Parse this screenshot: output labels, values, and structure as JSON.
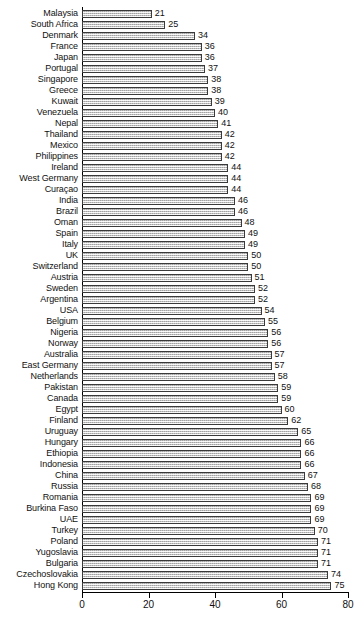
{
  "chart_data": {
    "type": "bar",
    "orientation": "horizontal",
    "title": "",
    "subtitle": "",
    "xlabel": "",
    "ylabel": "",
    "xlim": [
      0,
      80
    ],
    "xticks": [
      0,
      20,
      40,
      60,
      80
    ],
    "grid": false,
    "legend": null,
    "bar_value_labels": true,
    "categories": [
      "Malaysia",
      "South Africa",
      "Denmark",
      "France",
      "Japan",
      "Portugal",
      "Singapore",
      "Greece",
      "Kuwait",
      "Venezuela",
      "Nepal",
      "Thailand",
      "Mexico",
      "Philippines",
      "Ireland",
      "West Germany",
      "Curaçao",
      "India",
      "Brazil",
      "Oman",
      "Spain",
      "Italy",
      "UK",
      "Switzerland",
      "Austria",
      "Sweden",
      "Argentina",
      "USA",
      "Belgium",
      "Nigeria",
      "Norway",
      "Australia",
      "East Germany",
      "Netherlands",
      "Pakistan",
      "Canada",
      "Egypt",
      "Finland",
      "Uruguay",
      "Hungary",
      "Ethiopia",
      "Indonesia",
      "China",
      "Russia",
      "Romania",
      "Burkina Faso",
      "UAE",
      "Turkey",
      "Poland",
      "Yugoslavia",
      "Bulgaria",
      "Czechoslovakia",
      "Hong Kong"
    ],
    "values": [
      21,
      25,
      34,
      36,
      36,
      37,
      38,
      38,
      39,
      40,
      41,
      42,
      42,
      42,
      44,
      44,
      44,
      46,
      46,
      48,
      49,
      49,
      50,
      50,
      51,
      52,
      52,
      54,
      55,
      56,
      56,
      57,
      57,
      58,
      59,
      59,
      60,
      62,
      65,
      66,
      66,
      66,
      67,
      68,
      69,
      69,
      69,
      70,
      71,
      71,
      71,
      74,
      75
    ],
    "colors": {
      "bar_fill": "#d2d2d2",
      "bar_edge": "#3a3a3a",
      "axis": "#000000",
      "text": "#111111",
      "background": "#ffffff"
    }
  }
}
